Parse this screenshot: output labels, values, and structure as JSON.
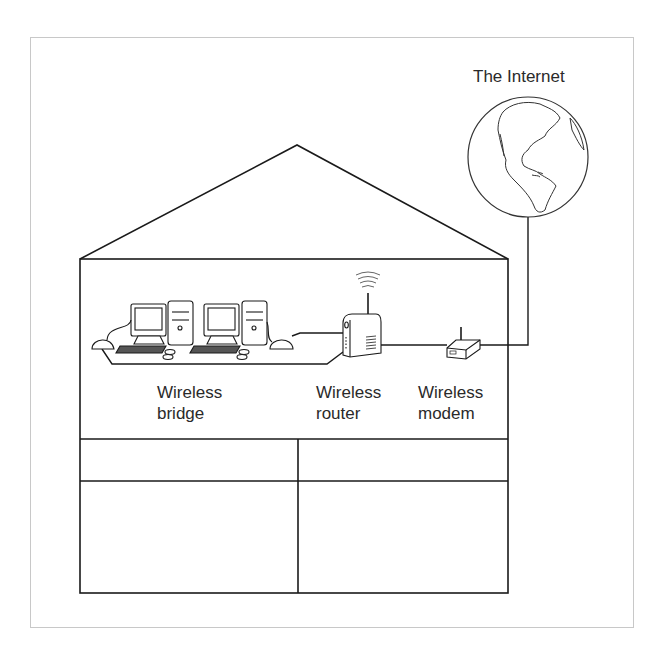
{
  "diagram": {
    "title_internet": "The Internet",
    "labels": {
      "bridge": {
        "line1": "Wireless",
        "line2": "bridge"
      },
      "router": {
        "line1": "Wireless",
        "line2": "router"
      },
      "modem": {
        "line1": "Wireless",
        "line2": "modem"
      }
    },
    "icons": [
      "globe-icon",
      "computer-icon",
      "computer-icon",
      "wireless-bridge-icon",
      "wireless-bridge-icon",
      "wireless-router-icon",
      "wireless-modem-icon",
      "wifi-signal-icon"
    ],
    "colors": {
      "line": "#1a1a1a",
      "frame": "#c8c8c8",
      "text": "#2a2a2a",
      "background": "#ffffff"
    }
  }
}
